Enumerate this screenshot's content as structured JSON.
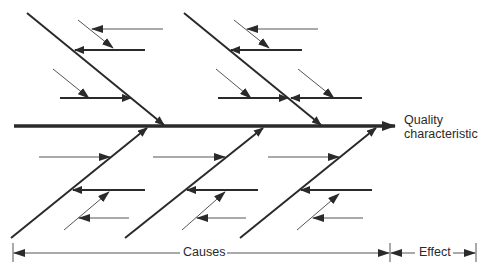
{
  "diagram": {
    "type": "fishbone",
    "effect_label_line1": "Quality",
    "effect_label_line2": "characteristic",
    "dimension_causes": "Causes",
    "dimension_effect": "Effect",
    "colors": {
      "line": "#2a2a2a",
      "background": "#ffffff"
    },
    "bones": {
      "top": 2,
      "bottom": 3
    }
  }
}
